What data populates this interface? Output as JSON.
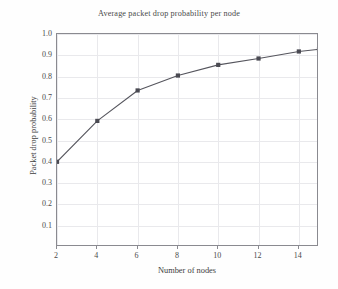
{
  "chart_data": {
    "type": "line",
    "title": "Average packet drop probability per node",
    "xlabel": "Number of nodes",
    "ylabel": "Packet drop probability",
    "x": [
      2,
      4,
      6,
      8,
      10,
      12,
      14,
      15
    ],
    "values": [
      0.4,
      0.592,
      0.735,
      0.805,
      0.855,
      0.885,
      0.918,
      0.928
    ],
    "series": [
      {
        "name": "Average packet drop probability",
        "values": [
          0.4,
          0.592,
          0.735,
          0.805,
          0.855,
          0.885,
          0.918,
          0.928
        ]
      }
    ],
    "xlim": [
      2,
      15
    ],
    "ylim": [
      0,
      1.0
    ],
    "xticks": [
      2,
      4,
      6,
      8,
      10,
      12,
      14
    ],
    "xtick_labels": [
      "2",
      "4",
      "6",
      "8",
      "10",
      "12",
      "14"
    ],
    "yticks": [
      0.1,
      0.2,
      0.3,
      0.4,
      0.5,
      0.6,
      0.7,
      0.8,
      0.9,
      1.0
    ],
    "ytick_labels": [
      "0.1",
      "0.2",
      "0.3",
      "0.4",
      "0.5",
      "0.6",
      "0.7",
      "0.8",
      "0.9",
      "1.0"
    ],
    "grid": true,
    "legend": "none",
    "marker": "square",
    "colors": {
      "line": "#55555d",
      "marker": "#4a4a52",
      "grid": "#e9e9ec",
      "axis": "#8a8a90",
      "text": "#3d3d3d",
      "background": "#ffffff"
    }
  }
}
